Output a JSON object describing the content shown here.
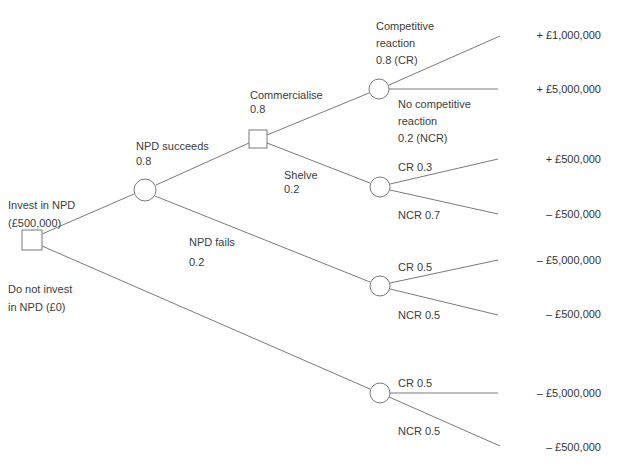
{
  "diagram": {
    "type": "decision-tree",
    "line_color": "#7a7a7a",
    "text_color": "#3c3c3c",
    "nodes": {
      "root_decision": {
        "shape": "square",
        "x": 32,
        "y": 240,
        "size": 20
      },
      "npd_chance": {
        "shape": "circle",
        "x": 145,
        "y": 190,
        "r": 11
      },
      "commercialise_decision": {
        "shape": "square",
        "x": 258,
        "y": 139,
        "size": 18
      },
      "reaction_chance": {
        "shape": "circle",
        "x": 379,
        "y": 89,
        "r": 10
      },
      "shelve_chance": {
        "shape": "circle",
        "x": 380,
        "y": 187,
        "r": 10
      },
      "fails_chance": {
        "shape": "circle",
        "x": 380,
        "y": 286,
        "r": 10
      },
      "no_invest_chance": {
        "shape": "circle",
        "x": 380,
        "y": 393,
        "r": 10
      }
    },
    "branch_labels": {
      "invest": {
        "line1": "Invest in NPD",
        "line2": "(£500,000)"
      },
      "no_invest": {
        "line1": "Do not invest",
        "line2": "in NPD (£0)"
      },
      "npd_succeeds": {
        "line1": "NPD succeeds",
        "line2": "0.8"
      },
      "npd_fails": {
        "line1": "NPD fails",
        "line2": "0.2"
      },
      "commercialise": {
        "line1": "Commercialise",
        "line2": "0.8"
      },
      "shelve": {
        "line1": "Shelve",
        "line2": "0.2"
      },
      "competitive_reaction": {
        "line1": "Competitive",
        "line2": "reaction",
        "line3": "0.8 (CR)"
      },
      "no_competitive_reaction": {
        "line1": "No competitive",
        "line2": "reaction",
        "line3": "0.2 (NCR)"
      },
      "shelve_cr": "CR 0.3",
      "shelve_ncr": "NCR 0.7",
      "fails_cr": "CR 0.5",
      "fails_ncr": "NCR 0.5",
      "no_invest_cr": "CR 0.5",
      "no_invest_ncr": "NCR 0.5"
    },
    "payoffs": [
      {
        "label": "+ £1,000,000",
        "y": 36
      },
      {
        "label": "+ £5,000,000",
        "y": 89
      },
      {
        "label": "+ £500,000",
        "y": 159
      },
      {
        "label": "– £500,000",
        "y": 214
      },
      {
        "label": "– £5,000,000",
        "y": 260
      },
      {
        "label": "– £500,000",
        "y": 315
      },
      {
        "label": "– £5,000,000",
        "y": 393
      },
      {
        "label": "– £500,000",
        "y": 446
      }
    ]
  }
}
